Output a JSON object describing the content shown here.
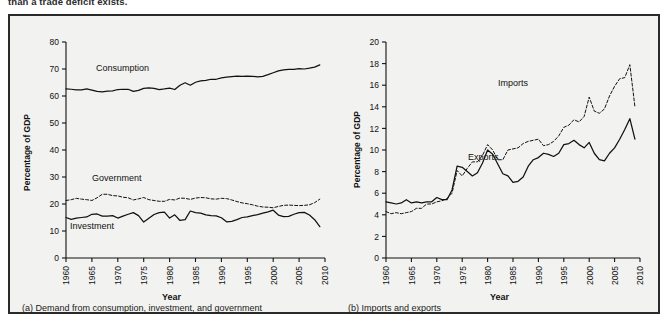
{
  "top_text": "than a trade deficit exists.",
  "figure": {
    "panels": [
      {
        "caption": "(a) Demand from consumption, investment, and government",
        "ylabel": "Percentage of GDP",
        "xlabel": "Year"
      },
      {
        "caption": "(b) Imports and exports",
        "ylabel": "Percentage of GDP",
        "xlabel": "Year"
      }
    ]
  },
  "labels": {
    "consumption": "Consumption",
    "government": "Government",
    "investment": "Investment",
    "imports": "Imports",
    "exports": "Exports"
  },
  "chart_data": [
    {
      "type": "line",
      "title": "(a) Demand from consumption, investment, and government",
      "xlabel": "Year",
      "ylabel": "Percentage of GDP",
      "xlim": [
        1960,
        2010
      ],
      "ylim": [
        0,
        80
      ],
      "yticks": [
        0,
        10,
        20,
        30,
        40,
        50,
        60,
        70,
        80
      ],
      "xticks": [
        1960,
        1965,
        1970,
        1975,
        1980,
        1985,
        1990,
        1995,
        2000,
        2005,
        2010
      ],
      "grid": false,
      "legend": "inline-annotations",
      "x": [
        1960,
        1961,
        1962,
        1963,
        1964,
        1965,
        1966,
        1967,
        1968,
        1969,
        1970,
        1971,
        1972,
        1973,
        1974,
        1975,
        1976,
        1977,
        1978,
        1979,
        1980,
        1981,
        1982,
        1983,
        1984,
        1985,
        1986,
        1987,
        1988,
        1989,
        1990,
        1991,
        1992,
        1993,
        1994,
        1995,
        1996,
        1997,
        1998,
        1999,
        2000,
        2001,
        2002,
        2003,
        2004,
        2005,
        2006,
        2007,
        2008,
        2009
      ],
      "series": [
        {
          "name": "Consumption",
          "style": "solid",
          "values": [
            62.6,
            62.5,
            62.3,
            62.3,
            62.6,
            62.2,
            61.7,
            61.5,
            61.8,
            61.9,
            62.4,
            62.5,
            62.5,
            61.7,
            62.1,
            62.8,
            63.0,
            62.8,
            62.4,
            62.6,
            62.9,
            62.4,
            64.0,
            64.9,
            64.0,
            65.1,
            65.6,
            65.8,
            66.2,
            66.2,
            66.7,
            67.0,
            67.2,
            67.4,
            67.3,
            67.4,
            67.3,
            67.1,
            67.3,
            67.9,
            68.6,
            69.3,
            69.7,
            69.9,
            69.9,
            70.1,
            70.0,
            70.3,
            70.7,
            71.5
          ]
        },
        {
          "name": "Government",
          "style": "dashed",
          "values": [
            21.3,
            21.6,
            22.1,
            21.8,
            21.6,
            21.3,
            22.3,
            23.6,
            23.6,
            23.1,
            23.0,
            22.5,
            22.3,
            21.5,
            21.9,
            22.4,
            21.6,
            21.3,
            21.0,
            21.0,
            21.7,
            21.5,
            22.2,
            22.1,
            21.7,
            22.2,
            22.4,
            22.3,
            21.9,
            21.8,
            22.1,
            22.0,
            21.5,
            20.9,
            20.4,
            20.1,
            19.7,
            19.2,
            18.9,
            18.8,
            18.6,
            19.1,
            19.5,
            19.6,
            19.5,
            19.4,
            19.5,
            19.7,
            20.5,
            21.8
          ]
        },
        {
          "name": "Investment",
          "style": "solid",
          "values": [
            15.0,
            14.3,
            14.8,
            15.0,
            15.2,
            16.2,
            16.3,
            15.5,
            15.5,
            15.7,
            14.8,
            15.5,
            16.2,
            16.8,
            15.7,
            13.3,
            14.7,
            16.1,
            16.8,
            17.0,
            14.8,
            16.0,
            13.9,
            14.2,
            17.4,
            16.8,
            16.6,
            16.0,
            15.7,
            15.6,
            14.9,
            13.4,
            13.6,
            14.2,
            15.0,
            15.2,
            15.7,
            16.1,
            16.6,
            17.1,
            17.7,
            15.9,
            15.3,
            15.4,
            16.2,
            16.8,
            16.9,
            15.9,
            14.2,
            11.6
          ]
        }
      ]
    },
    {
      "type": "line",
      "title": "(b) Imports and exports",
      "xlabel": "Year",
      "ylabel": "Percentage of GDP",
      "xlim": [
        1960,
        2010
      ],
      "ylim": [
        0,
        20
      ],
      "yticks": [
        0,
        2,
        4,
        6,
        8,
        10,
        12,
        14,
        16,
        18,
        20
      ],
      "xticks": [
        1960,
        1965,
        1970,
        1975,
        1980,
        1985,
        1990,
        1995,
        2000,
        2005,
        2010
      ],
      "grid": false,
      "legend": "inline-annotations",
      "x": [
        1960,
        1961,
        1962,
        1963,
        1964,
        1965,
        1966,
        1967,
        1968,
        1969,
        1970,
        1971,
        1972,
        1973,
        1974,
        1975,
        1976,
        1977,
        1978,
        1979,
        1980,
        1981,
        1982,
        1983,
        1984,
        1985,
        1986,
        1987,
        1988,
        1989,
        1990,
        1991,
        1992,
        1993,
        1994,
        1995,
        1996,
        1997,
        1998,
        1999,
        2000,
        2001,
        2002,
        2003,
        2004,
        2005,
        2006,
        2007,
        2008,
        2009
      ],
      "series": [
        {
          "name": "Imports",
          "style": "dashed",
          "values": [
            4.3,
            4.1,
            4.2,
            4.1,
            4.2,
            4.3,
            4.6,
            4.6,
            5.0,
            5.0,
            5.2,
            5.3,
            5.5,
            6.0,
            8.1,
            7.6,
            8.3,
            8.9,
            8.9,
            9.5,
            10.5,
            10.0,
            9.1,
            9.1,
            10.0,
            10.1,
            10.2,
            10.6,
            10.8,
            10.9,
            11.0,
            10.4,
            10.5,
            10.8,
            11.3,
            12.1,
            12.3,
            12.8,
            12.6,
            13.1,
            14.9,
            13.6,
            13.4,
            13.8,
            15.0,
            15.9,
            16.6,
            16.7,
            17.9,
            14.0
          ]
        },
        {
          "name": "Exports",
          "style": "solid",
          "values": [
            5.2,
            5.1,
            5.0,
            5.1,
            5.4,
            5.1,
            5.2,
            5.1,
            5.2,
            5.2,
            5.6,
            5.4,
            5.4,
            6.3,
            8.5,
            8.4,
            8.0,
            7.6,
            7.9,
            8.8,
            10.0,
            9.6,
            8.7,
            7.8,
            7.6,
            7.0,
            7.1,
            7.5,
            8.5,
            9.1,
            9.3,
            9.7,
            9.6,
            9.4,
            9.7,
            10.5,
            10.6,
            10.9,
            10.5,
            10.2,
            10.7,
            9.7,
            9.1,
            9.0,
            9.7,
            10.2,
            11.0,
            11.9,
            12.9,
            11.0
          ]
        }
      ]
    }
  ]
}
